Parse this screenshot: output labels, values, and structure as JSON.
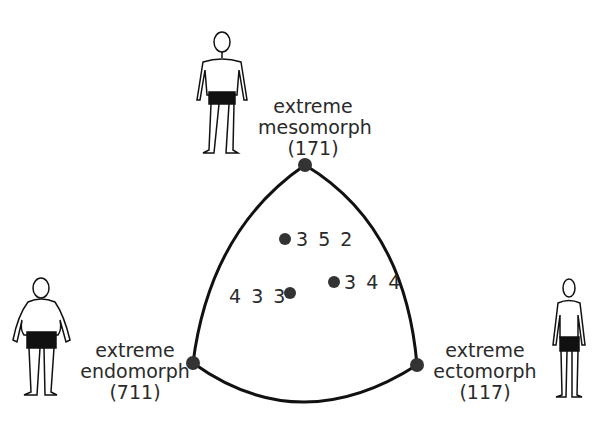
{
  "diagram": {
    "line_color": "#111111",
    "dot_color": "#333333",
    "vertices": [
      {
        "id": "mesomorph",
        "line1": "extreme",
        "line2": "mesomorph",
        "code": "(171)",
        "x": 305,
        "y": 165
      },
      {
        "id": "endomorph",
        "line1": "extreme",
        "line2": "endomorph",
        "code": "(711)",
        "x": 193,
        "y": 363
      },
      {
        "id": "ectomorph",
        "line1": "extreme",
        "line2": "ectomorph",
        "code": "(117)",
        "x": 417,
        "y": 365
      }
    ],
    "points": [
      {
        "label": "3 5 2",
        "x": 285,
        "y": 239
      },
      {
        "label": "3 4 4",
        "x": 334,
        "y": 282
      },
      {
        "label": "4 3 3",
        "x": 290,
        "y": 293
      }
    ],
    "figures": [
      "mesomorph-figure",
      "endomorph-figure",
      "ectomorph-figure"
    ]
  }
}
